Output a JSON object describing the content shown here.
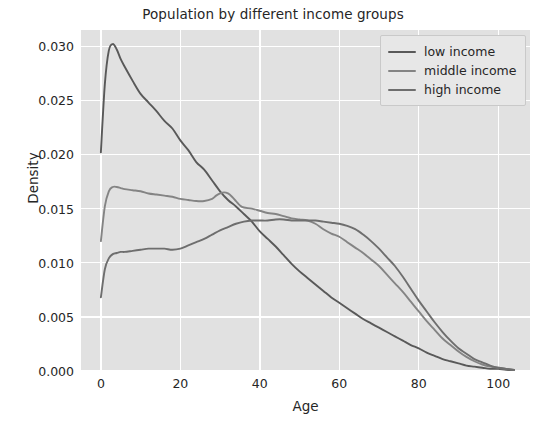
{
  "chart_data": {
    "type": "line",
    "title": "Population by different income groups",
    "xlabel": "Age",
    "ylabel": "Density",
    "xlim": [
      -5,
      108
    ],
    "ylim": [
      0.0,
      0.0315
    ],
    "xticks": [
      0,
      20,
      40,
      60,
      80,
      100
    ],
    "xtick_labels": [
      "0",
      "20",
      "40",
      "60",
      "80",
      "100"
    ],
    "yticks": [
      0.0,
      0.005,
      0.01,
      0.015,
      0.02,
      0.025,
      0.03
    ],
    "ytick_labels": [
      "0.000",
      "0.005",
      "0.010",
      "0.015",
      "0.020",
      "0.025",
      "0.030"
    ],
    "grid": true,
    "legend_position": "upper right",
    "plot_background": "#e1e1e1",
    "grid_color": "#ffffff",
    "series": [
      {
        "name": "low income",
        "color": "#595959",
        "x": [
          0,
          1,
          2,
          3,
          4,
          5,
          6,
          8,
          10,
          12,
          14,
          16,
          18,
          20,
          22,
          24,
          26,
          28,
          30,
          32,
          34,
          36,
          38,
          40,
          42,
          44,
          46,
          48,
          50,
          52,
          54,
          56,
          58,
          60,
          62,
          64,
          66,
          68,
          70,
          72,
          74,
          76,
          78,
          80,
          82,
          84,
          86,
          88,
          90,
          92,
          94,
          96,
          98,
          100,
          102,
          104
        ],
        "y": [
          0.0202,
          0.0265,
          0.0296,
          0.0302,
          0.0297,
          0.0288,
          0.0281,
          0.0268,
          0.0256,
          0.0248,
          0.024,
          0.0231,
          0.0224,
          0.0213,
          0.0204,
          0.0193,
          0.0186,
          0.0176,
          0.0166,
          0.0158,
          0.0152,
          0.0145,
          0.0138,
          0.0129,
          0.0122,
          0.0115,
          0.0107,
          0.0099,
          0.0092,
          0.0086,
          0.008,
          0.0074,
          0.0068,
          0.0063,
          0.0058,
          0.0053,
          0.0048,
          0.0044,
          0.004,
          0.0036,
          0.0032,
          0.0028,
          0.0024,
          0.0021,
          0.0017,
          0.0014,
          0.0011,
          0.0009,
          0.0007,
          0.0005,
          0.0004,
          0.0003,
          0.0002,
          0.0002,
          0.0001,
          0.0001
        ]
      },
      {
        "name": "middle income",
        "color": "#848484",
        "x": [
          0,
          1,
          2,
          3,
          4,
          5,
          6,
          8,
          10,
          12,
          14,
          16,
          18,
          20,
          22,
          24,
          26,
          28,
          29,
          30,
          31,
          32,
          33,
          34,
          35,
          36,
          38,
          40,
          42,
          44,
          46,
          48,
          50,
          52,
          54,
          56,
          58,
          60,
          62,
          64,
          66,
          68,
          70,
          72,
          74,
          76,
          78,
          80,
          82,
          84,
          86,
          88,
          90,
          92,
          94,
          96,
          98,
          100,
          102,
          104
        ],
        "y": [
          0.012,
          0.0152,
          0.0166,
          0.017,
          0.017,
          0.0169,
          0.0168,
          0.0167,
          0.0166,
          0.0164,
          0.0163,
          0.0162,
          0.0161,
          0.0159,
          0.0158,
          0.0157,
          0.0157,
          0.0159,
          0.0162,
          0.0164,
          0.0165,
          0.0164,
          0.0161,
          0.0157,
          0.0153,
          0.0151,
          0.015,
          0.0148,
          0.0146,
          0.0145,
          0.0143,
          0.0141,
          0.014,
          0.0139,
          0.0136,
          0.0131,
          0.0127,
          0.0124,
          0.0119,
          0.0114,
          0.0109,
          0.0103,
          0.0097,
          0.0089,
          0.0081,
          0.0073,
          0.0064,
          0.0055,
          0.0046,
          0.0038,
          0.003,
          0.0024,
          0.0018,
          0.0013,
          0.0009,
          0.0006,
          0.0004,
          0.0003,
          0.0002,
          0.0001
        ]
      },
      {
        "name": "high income",
        "color": "#6e6e6e",
        "x": [
          0,
          1,
          2,
          3,
          4,
          5,
          6,
          8,
          10,
          12,
          14,
          16,
          18,
          20,
          22,
          24,
          26,
          28,
          30,
          32,
          34,
          36,
          38,
          40,
          42,
          44,
          46,
          48,
          50,
          52,
          54,
          56,
          58,
          60,
          62,
          64,
          66,
          68,
          70,
          72,
          74,
          76,
          78,
          80,
          82,
          84,
          86,
          88,
          90,
          92,
          94,
          96,
          98,
          100,
          102,
          104
        ],
        "y": [
          0.0068,
          0.0094,
          0.0104,
          0.0108,
          0.0109,
          0.011,
          0.011,
          0.0111,
          0.0112,
          0.0113,
          0.0113,
          0.0113,
          0.0112,
          0.0113,
          0.0116,
          0.0119,
          0.0122,
          0.0126,
          0.013,
          0.0133,
          0.0136,
          0.0138,
          0.0139,
          0.0139,
          0.0139,
          0.014,
          0.014,
          0.0139,
          0.0139,
          0.0139,
          0.0139,
          0.0138,
          0.0137,
          0.0136,
          0.0134,
          0.0131,
          0.0126,
          0.012,
          0.0113,
          0.0105,
          0.0097,
          0.0087,
          0.0076,
          0.0065,
          0.0055,
          0.0045,
          0.0036,
          0.0028,
          0.0021,
          0.0016,
          0.0011,
          0.0008,
          0.0005,
          0.0003,
          0.0002,
          0.0001
        ]
      }
    ]
  },
  "legend": {
    "items": [
      {
        "label": "low income"
      },
      {
        "label": "middle income"
      },
      {
        "label": "high income"
      }
    ]
  }
}
